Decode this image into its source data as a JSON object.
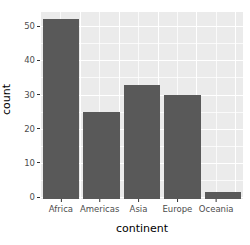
{
  "chart_data": {
    "type": "bar",
    "title": "",
    "subtitle": "",
    "xlabel": "continent",
    "ylabel": "count",
    "categories": [
      "Africa",
      "Americas",
      "Asia",
      "Europe",
      "Oceania"
    ],
    "values": [
      52,
      25,
      33,
      30,
      2
    ],
    "ylim": [
      0,
      54
    ],
    "xlim": [
      0.4,
      5.6
    ],
    "y_ticks": [
      0,
      10,
      20,
      30,
      40,
      50
    ],
    "y_tick_labels": [
      "0",
      "10",
      "20",
      "30",
      "40",
      "50"
    ],
    "y_minor_ticks": [
      5,
      15,
      25,
      35,
      45
    ],
    "grid": true,
    "grid_color": "#ffffff",
    "panel_background": "#ebebeb",
    "plot_background": "#ffffff",
    "bar_color": "#595959",
    "axis_text_color": "#4d4d4d",
    "axis_title_color": "#000000",
    "legend": "none",
    "legend_position": "none",
    "annotations": []
  },
  "axes": {
    "y": {
      "title": "count",
      "ticks": [
        {
          "label": "50",
          "value": 50
        },
        {
          "label": "40",
          "value": 40
        },
        {
          "label": "30",
          "value": 30
        },
        {
          "label": "20",
          "value": 20
        },
        {
          "label": "10",
          "value": 10
        },
        {
          "label": "0",
          "value": 0
        }
      ]
    },
    "x": {
      "title": "continent",
      "ticks": [
        {
          "label": "Africa",
          "value": 1
        },
        {
          "label": "Americas",
          "value": 2
        },
        {
          "label": "Asia",
          "value": 3
        },
        {
          "label": "Europe",
          "value": 4
        },
        {
          "label": "Oceania",
          "value": 5
        }
      ]
    }
  }
}
